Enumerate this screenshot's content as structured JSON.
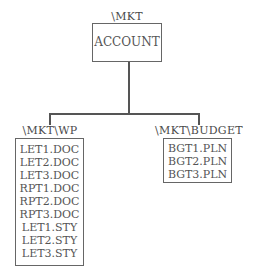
{
  "root": {
    "path": "\\MKT",
    "items": [
      "ACCOUNT"
    ]
  },
  "children": [
    {
      "path": "\\MKT\\WP",
      "items": [
        "LET1.DOC",
        "LET2.DOC",
        "LET3.DOC",
        "RPT1.DOC",
        "RPT2.DOC",
        "RPT3.DOC",
        "LET1.STY",
        "LET2.STY",
        "LET3.STY"
      ]
    },
    {
      "path": "\\MKT\\BUDGET",
      "items": [
        "BGT1.PLN",
        "BGT2.PLN",
        "BGT3.PLN"
      ]
    }
  ]
}
